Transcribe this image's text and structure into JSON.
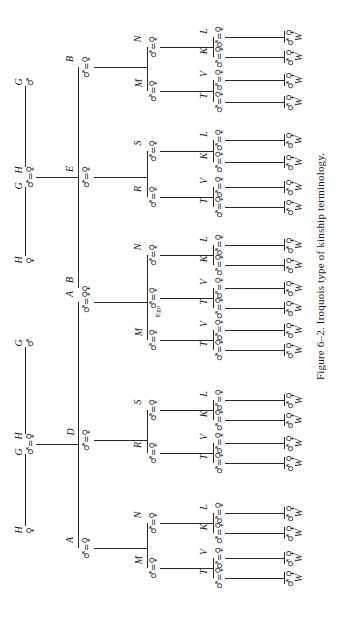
{
  "figure": {
    "caption": "Figure 6–2. Iroquois type of kinship terminology.",
    "orientation": "rotated 90° counter-clockwise",
    "symbols": {
      "male": "♂",
      "female": "♀",
      "marriage": "="
    }
  },
  "generations": {
    "grandparents": [
      {
        "label": "G",
        "sex": "♂",
        "y": 82
      },
      {
        "label": "H",
        "sex": "♀",
        "y": 170,
        "pair_with": "G"
      },
      {
        "label": "G",
        "sex": "♂",
        "y": 186,
        "pair_with": "H"
      },
      {
        "label": "H",
        "sex": "♀",
        "y": 260
      },
      {
        "label": "G",
        "sex": "♂",
        "y": 343
      },
      {
        "label": "H",
        "sex": "♀",
        "y": 436,
        "pair_with": "G"
      },
      {
        "label": "G",
        "sex": "♂",
        "y": 452,
        "pair_with": "H"
      },
      {
        "label": "H",
        "sex": "♀",
        "y": 530
      }
    ],
    "parents": [
      {
        "label": "B",
        "symbol": "♂=♀",
        "y": 67
      },
      {
        "label": "E",
        "symbol": "♂=♀",
        "y": 177
      },
      {
        "label": "B",
        "symbol": "♀",
        "y": 288
      },
      {
        "label": "A",
        "symbol": "♂=♀",
        "y": 302
      },
      {
        "label": "D",
        "symbol": "♂=♀",
        "y": 440
      },
      {
        "label": "A",
        "symbol": "♂=♀",
        "y": 548
      }
    ],
    "children": [
      {
        "label": "N",
        "symbol": "♂=♀",
        "y": 47
      },
      {
        "label": "M",
        "symbol": "♂=♀",
        "y": 91
      },
      {
        "label": "S",
        "symbol": "♂=♀",
        "y": 151
      },
      {
        "label": "R",
        "symbol": "♂=♀",
        "y": 197
      },
      {
        "label": "N",
        "symbol": "♂=♀",
        "y": 255
      },
      {
        "label": "",
        "symbol": "♂=♀",
        "y": 298,
        "sub": "Ego"
      },
      {
        "label": "M",
        "symbol": "♂=♀",
        "y": 340
      },
      {
        "label": "S",
        "symbol": "♂=♀",
        "y": 410
      },
      {
        "label": "R",
        "symbol": "♂=♀",
        "y": 453
      },
      {
        "label": "N",
        "symbol": "♂=♀",
        "y": 523
      },
      {
        "label": "M",
        "symbol": "♂=♀",
        "y": 568
      }
    ],
    "grandchildren": [
      {
        "label": "L",
        "y": 37
      },
      {
        "label": "K",
        "y": 57
      },
      {
        "label": "V",
        "y": 80
      },
      {
        "label": "T",
        "y": 102
      },
      {
        "label": "L",
        "y": 140
      },
      {
        "label": "K",
        "y": 162
      },
      {
        "label": "V",
        "y": 187
      },
      {
        "label": "T",
        "y": 207
      },
      {
        "label": "L",
        "y": 245
      },
      {
        "label": "K",
        "y": 265
      },
      {
        "label": "V",
        "y": 288
      },
      {
        "label": "T",
        "y": 308
      },
      {
        "label": "V",
        "y": 330
      },
      {
        "label": "T",
        "y": 350
      },
      {
        "label": "L",
        "y": 400
      },
      {
        "label": "K",
        "y": 420
      },
      {
        "label": "V",
        "y": 443
      },
      {
        "label": "T",
        "y": 463
      },
      {
        "label": "L",
        "y": 513
      },
      {
        "label": "K",
        "y": 533
      },
      {
        "label": "V",
        "y": 558
      },
      {
        "label": "T",
        "y": 578
      }
    ],
    "great_grandchildren": {
      "label": "W",
      "symbols": [
        "♀",
        "♂"
      ],
      "count": 22
    }
  }
}
